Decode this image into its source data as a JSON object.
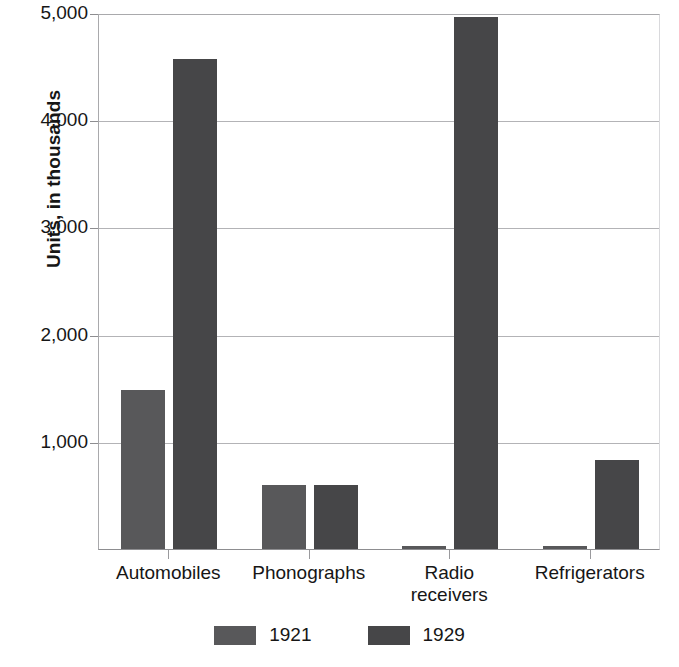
{
  "chart_data": {
    "type": "bar",
    "title": "",
    "xlabel": "",
    "ylabel": "Units, in thousands",
    "categories": [
      "Automobiles",
      "Phonographs",
      "Radio receivers",
      "Refrigerators"
    ],
    "category_lines": [
      [
        "Automobiles"
      ],
      [
        "Phonographs"
      ],
      [
        "Radio",
        "receivers"
      ],
      [
        "Refrigerators"
      ]
    ],
    "series": [
      {
        "name": "1921",
        "color": "#58585a",
        "values": [
          1480,
          600,
          30,
          25
        ]
      },
      {
        "name": "1929",
        "color": "#464648",
        "values": [
          4570,
          600,
          4960,
          830
        ]
      }
    ],
    "ylim": [
      0,
      5000
    ],
    "yticks": [
      0,
      1000,
      2000,
      3000,
      4000,
      5000
    ],
    "ytick_labels": [
      "",
      "1,000",
      "2,000",
      "3,000",
      "4,000",
      "5,000"
    ],
    "grid": true,
    "legend_position": "bottom"
  },
  "legend": {
    "items": [
      {
        "label": "1921",
        "color": "#58585a"
      },
      {
        "label": "1929",
        "color": "#464648"
      }
    ]
  },
  "axis": {
    "y_title": "Units, in thousands"
  }
}
